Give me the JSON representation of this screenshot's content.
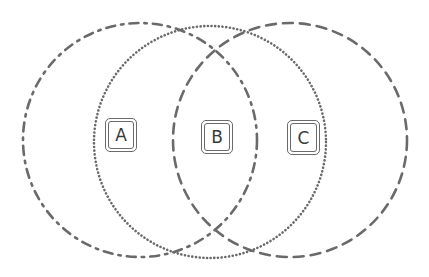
{
  "diagram": {
    "type": "venn",
    "stroke_color": "#6a6a6a",
    "background": "#ffffff",
    "circles": [
      {
        "id": "left",
        "style": "dash-dot",
        "cx": 140,
        "cy": 140,
        "r": 117
      },
      {
        "id": "middle",
        "style": "dotted",
        "cx": 210,
        "cy": 142,
        "r": 116
      },
      {
        "id": "right",
        "style": "dashed",
        "cx": 290,
        "cy": 140,
        "r": 117
      }
    ],
    "labels": [
      {
        "id": "A",
        "text": "A",
        "x": 105,
        "y": 118,
        "w": 32,
        "h": 34
      },
      {
        "id": "B",
        "text": "B",
        "x": 201,
        "y": 120,
        "w": 32,
        "h": 34
      },
      {
        "id": "C",
        "text": "C",
        "x": 287,
        "y": 120,
        "w": 33,
        "h": 35
      }
    ]
  }
}
